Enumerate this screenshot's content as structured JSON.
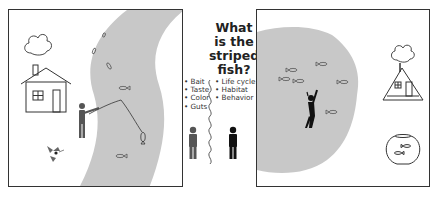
{
  "title": "What is the striped fish?",
  "title_lines": [
    "What",
    "is the",
    "striped",
    "fish?"
  ],
  "left_list": [
    "Bait",
    "Taste",
    "Color",
    "Guts"
  ],
  "right_list": [
    "Life cycle",
    "Habitat",
    "Behavior"
  ],
  "colors": {
    "water": "#c8c8c8",
    "outline": "#333333",
    "person_left": "#555555",
    "person_right": "#111111"
  },
  "left_panel": {
    "elements": [
      "cloud",
      "house",
      "river",
      "fisherman",
      "fishing-rod",
      "caught-fish",
      "fish-remains",
      "river-fish"
    ]
  },
  "right_panel": {
    "elements": [
      "lake",
      "snorkeler",
      "lake-fish",
      "cloud",
      "a-frame-house",
      "fishbowl"
    ]
  }
}
